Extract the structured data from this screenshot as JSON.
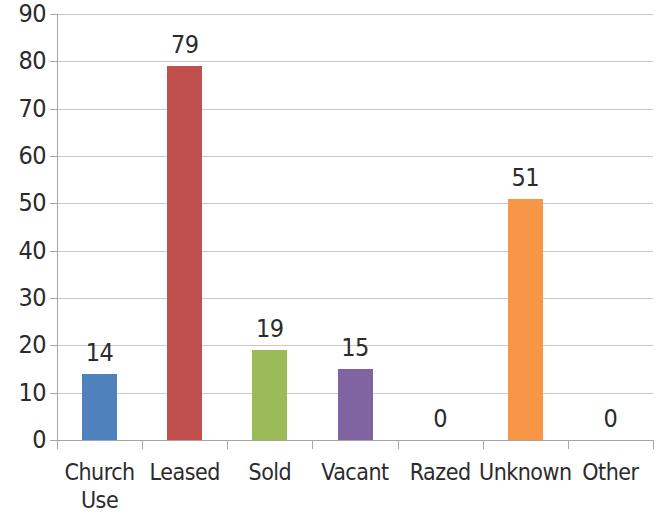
{
  "chart_data": {
    "type": "bar",
    "title": "",
    "subtitle": "",
    "xlabel": "",
    "ylabel": "",
    "categories": [
      "Church\nUse",
      "Leased",
      "Sold",
      "Vacant",
      "Razed",
      "Unknown",
      "Other"
    ],
    "values": [
      14,
      79,
      19,
      15,
      0,
      51,
      0
    ],
    "data_labels": [
      "14",
      "79",
      "19",
      "15",
      "0",
      "51",
      "0"
    ],
    "colors": [
      "#4f81bd",
      "#c0504d",
      "#9bbb59",
      "#8064a2",
      "#4f81bd",
      "#f79646",
      "#c0504d"
    ],
    "ylim": [
      0,
      90
    ],
    "ytick_labels": [
      "90",
      "80",
      "70",
      "60",
      "50",
      "40",
      "30",
      "20",
      "10",
      "0"
    ],
    "ytick_values": [
      90,
      80,
      70,
      60,
      50,
      40,
      30,
      20,
      10,
      0
    ],
    "grid": true,
    "grid_axis": "y",
    "legend": false,
    "legend_position": "none",
    "series": [
      {
        "name": "",
        "values": [
          14,
          79,
          19,
          15,
          0,
          51,
          0
        ]
      }
    ],
    "axis_color": "#a6a6a6",
    "gridline_color": "#c9c9c9",
    "background_color": "#ffffff",
    "text_color": "#2b2b2b"
  }
}
